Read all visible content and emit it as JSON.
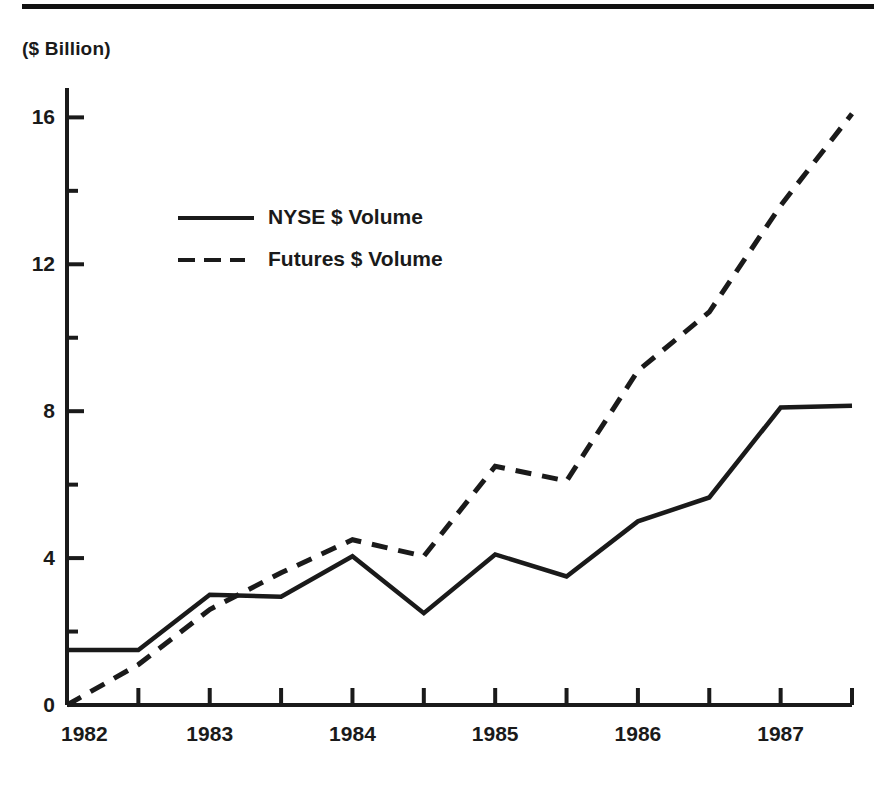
{
  "header": {
    "rule": "top-divider"
  },
  "axis": {
    "unit_label": "($ Billion)",
    "y_ticks": [
      "0",
      "4",
      "8",
      "12",
      "16"
    ],
    "x_ticks": [
      "1982",
      "1983",
      "1984",
      "1985",
      "1986",
      "1987"
    ]
  },
  "legend": {
    "items": [
      {
        "label": "NYSE $ Volume",
        "style": "solid"
      },
      {
        "label": "Futures $ Volume",
        "style": "dashed"
      }
    ]
  },
  "chart_data": {
    "type": "line",
    "title": "",
    "subtitle": "",
    "xlabel": "",
    "ylabel": "($ Billion)",
    "ylim": [
      0,
      16.8
    ],
    "xlim": [
      1982.0,
      1987.5
    ],
    "grid": false,
    "legend_position": "inside-upper-left",
    "y_major_ticks": [
      0,
      4,
      8,
      12,
      16
    ],
    "y_minor_ticks": [
      2,
      6,
      10,
      14
    ],
    "x_major_ticks": [
      1982,
      1983,
      1984,
      1985,
      1986,
      1987
    ],
    "x_minor_ticks": [
      1982.5,
      1983.5,
      1984.5,
      1985.5,
      1986.5,
      1987.5
    ],
    "x": [
      1982.0,
      1982.5,
      1983.0,
      1983.5,
      1984.0,
      1984.5,
      1985.0,
      1985.5,
      1986.0,
      1986.5,
      1987.0,
      1987.5
    ],
    "series": [
      {
        "name": "NYSE $ Volume",
        "style": "solid",
        "color": "#1a1a1a",
        "values": [
          1.5,
          1.5,
          3.0,
          2.95,
          4.05,
          2.5,
          4.1,
          3.5,
          5.0,
          5.65,
          8.1,
          8.15
        ]
      },
      {
        "name": "Futures $ Volume",
        "style": "dashed",
        "color": "#1a1a1a",
        "values": [
          0.0,
          1.1,
          2.6,
          3.6,
          4.5,
          4.05,
          6.5,
          6.1,
          9.1,
          10.7,
          13.6,
          16.1
        ]
      }
    ]
  }
}
